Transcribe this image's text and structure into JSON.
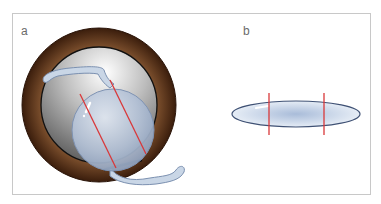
{
  "figure": {
    "panels": [
      {
        "label": "a",
        "description": "Frontal view of intraocular lens with haptics placed over iris/pupil, two red lines across optic"
      },
      {
        "label": "b",
        "description": "Side view of lens optic as thin ellipse with two vertical red lines"
      }
    ],
    "colors": {
      "border": "#c8c8c8",
      "iris_outer": "#3a1d0c",
      "iris_mid": "#8a5a34",
      "pupil_light": "#f2f2f2",
      "pupil_dark": "#7a7a7a",
      "lens_fill": "#b8c6dc",
      "lens_stroke": "#5b6f95",
      "haptic_fill": "#c9d6e6",
      "marker_red": "#d9383a"
    }
  }
}
